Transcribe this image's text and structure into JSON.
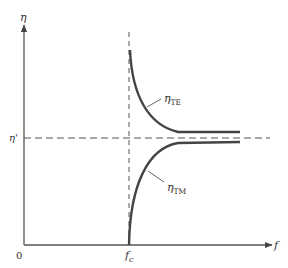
{
  "diagram": {
    "title": "",
    "axes": {
      "y_label": "η",
      "x_label": "f",
      "origin_label": "0",
      "cutoff_label_main": "f",
      "cutoff_label_sub": "c",
      "reference_label": "η'"
    },
    "curves": [
      {
        "name": "TE",
        "label_main": "η",
        "label_sub": "TE",
        "behavior": "decreasing from infinity at f_c toward η'"
      },
      {
        "name": "TM",
        "label_main": "η",
        "label_sub": "TM",
        "behavior": "increasing from 0 at f_c toward η'"
      }
    ],
    "colors": {
      "axis": "#555555",
      "curve": "#444444",
      "dashed": "#555555",
      "text": "#333333"
    }
  }
}
